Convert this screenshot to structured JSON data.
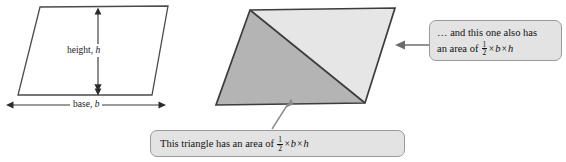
{
  "figure": {
    "background_color": "#ffffff",
    "stroke_color": "#3a3a3a"
  },
  "shapes": {
    "parallelogram_plain": {
      "name": "plain parallelogram",
      "points": "40,7 168,6 152,95 18,95",
      "fill": "#ffffff",
      "stroke": "#4a4a4a"
    },
    "parallelogram_split": {
      "name": "parallelogram split by diagonal",
      "points": "250,10 395,8 365,103 216,105",
      "stroke": "#3c3c3c",
      "triangle_lower_left": {
        "points": "250,10 365,103 216,105",
        "fill": "#b4b4b4"
      },
      "triangle_upper_right": {
        "points": "250,10 395,8 365,103",
        "fill": "#e6e6e6"
      },
      "diagonal": {
        "from": "250,10",
        "to": "365,103"
      }
    }
  },
  "dimensions": {
    "height": {
      "label_prefix": "height, ",
      "label_var": "h",
      "arrow_x": 98,
      "arrow_y_top": 8,
      "arrow_y_bottom": 95
    },
    "base": {
      "label_prefix": "base, ",
      "label_var": "b",
      "arrow_y": 105,
      "arrow_x_left": 6,
      "arrow_x_right": 165
    }
  },
  "callouts": {
    "right": {
      "line1": "… and this one also has",
      "line2_prefix": "an area of ",
      "fraction_numerator": "1",
      "fraction_denominator": "2",
      "times_symbol": "×",
      "var_b": "b",
      "var_h": "h",
      "background_color": "#e3e3e3",
      "border_color": "#9a9a9a",
      "pointer": {
        "from_x": 429,
        "from_y": 45,
        "to_x": 396,
        "to_y": 45
      }
    },
    "bottom": {
      "text_prefix": "This triangle has an area of ",
      "fraction_numerator": "1",
      "fraction_denominator": "2",
      "times_symbol": "×",
      "var_b": "b",
      "var_h": "h",
      "background_color": "#e3e3e3",
      "border_color": "#9a9a9a",
      "pointer": {
        "from_x": 272,
        "from_y": 128,
        "to_x": 291,
        "to_y": 99
      }
    }
  }
}
